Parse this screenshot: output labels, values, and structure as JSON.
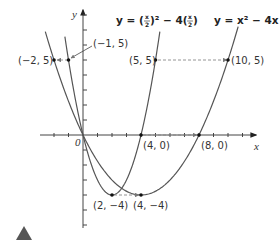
{
  "diagram": {
    "axes": {
      "x_label": "x",
      "y_label": "y",
      "origin_label": "0",
      "x_range": [
        -3,
        12
      ],
      "y_range": [
        -6,
        8
      ]
    },
    "curves": [
      {
        "name": "stretched",
        "label": "y = (x/2)² − 4(x/2)",
        "label_parts": {
          "y": "y",
          "eq": "=",
          "a": "(",
          "frac": "x/2",
          "b": ")² − 4(",
          "c": ")"
        },
        "vertex": [
          4,
          -4
        ],
        "color": "#555555"
      },
      {
        "name": "original",
        "label": "y = x² − 4x",
        "vertex": [
          2,
          -4
        ],
        "color": "#555555"
      }
    ],
    "points": [
      {
        "label": "(−2, 5)",
        "x": -2,
        "y": 5
      },
      {
        "label": "(−1, 5)",
        "x": -1,
        "y": 5
      },
      {
        "label": "(5, 5)",
        "x": 5,
        "y": 5
      },
      {
        "label": "(10, 5)",
        "x": 10,
        "y": 5
      },
      {
        "label": "(4, 0)",
        "x": 4,
        "y": 0
      },
      {
        "label": "(8, 0)",
        "x": 8,
        "y": 0
      },
      {
        "label": "(2, −4)",
        "x": 2,
        "y": -4
      },
      {
        "label": "(4, −4)",
        "x": 4,
        "y": -4
      }
    ],
    "equations": {
      "eq1": "y = (x/2)² − 4(x/2)",
      "eq2": "y = x² − 4x"
    },
    "marker": "triangle-icon"
  }
}
